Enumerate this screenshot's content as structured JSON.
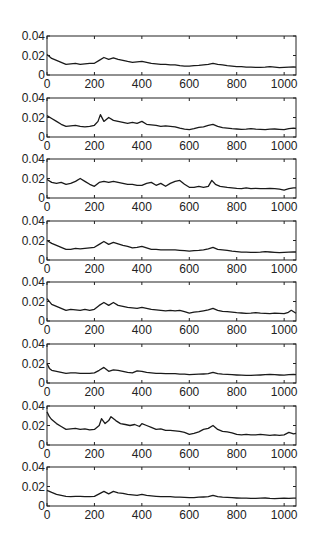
{
  "figure": {
    "background": "#ffffff",
    "line_color": "#1a1a1a",
    "axis_color": "#222222"
  },
  "layout": {
    "plot_left": 47,
    "plot_right": 296,
    "first_top": 36,
    "pitch": 61.6,
    "plot_height": 39
  },
  "chart_data": [
    {
      "type": "line",
      "title": "",
      "xlabel": "",
      "ylabel": "",
      "xlim": [
        0,
        1050
      ],
      "ylim": [
        0,
        0.04
      ],
      "xticks": [
        0,
        200,
        400,
        600,
        800,
        1000
      ],
      "xtick_labels": [
        "0",
        "200",
        "400",
        "600",
        "800",
        "1000"
      ],
      "yticks": [
        0,
        0.02,
        0.04
      ],
      "ytick_labels": [
        "0",
        "0.02",
        "0.04"
      ],
      "grid": false,
      "legend": null,
      "x": [
        0,
        20,
        40,
        60,
        80,
        100,
        120,
        140,
        160,
        180,
        200,
        220,
        240,
        260,
        280,
        300,
        320,
        340,
        360,
        380,
        400,
        420,
        440,
        460,
        480,
        500,
        520,
        540,
        560,
        580,
        600,
        620,
        640,
        660,
        680,
        700,
        720,
        740,
        760,
        780,
        800,
        820,
        840,
        860,
        880,
        900,
        920,
        940,
        960,
        980,
        1000,
        1020,
        1040,
        1050
      ],
      "values": [
        0.021,
        0.017,
        0.015,
        0.013,
        0.011,
        0.0115,
        0.012,
        0.011,
        0.0115,
        0.012,
        0.012,
        0.015,
        0.018,
        0.016,
        0.0175,
        0.016,
        0.015,
        0.014,
        0.013,
        0.0135,
        0.014,
        0.013,
        0.012,
        0.0115,
        0.011,
        0.011,
        0.0105,
        0.0105,
        0.0095,
        0.009,
        0.009,
        0.0095,
        0.01,
        0.0105,
        0.011,
        0.012,
        0.011,
        0.0105,
        0.0095,
        0.009,
        0.0085,
        0.0085,
        0.008,
        0.008,
        0.0078,
        0.0078,
        0.008,
        0.0085,
        0.008,
        0.0075,
        0.0078,
        0.008,
        0.0082,
        0.008
      ]
    },
    {
      "type": "line",
      "title": "",
      "xlabel": "",
      "ylabel": "",
      "xlim": [
        0,
        1050
      ],
      "ylim": [
        0,
        0.04
      ],
      "xticks": [
        0,
        200,
        400,
        600,
        800,
        1000
      ],
      "xtick_labels": [
        "0",
        "200",
        "400",
        "600",
        "800",
        "1000"
      ],
      "yticks": [
        0,
        0.02,
        0.04
      ],
      "ytick_labels": [
        "0",
        "0.02",
        "0.04"
      ],
      "grid": false,
      "legend": null,
      "x": [
        0,
        20,
        40,
        60,
        80,
        100,
        120,
        140,
        160,
        180,
        200,
        215,
        225,
        240,
        260,
        280,
        300,
        320,
        340,
        360,
        380,
        400,
        420,
        440,
        460,
        480,
        500,
        520,
        540,
        560,
        580,
        600,
        620,
        640,
        660,
        680,
        700,
        720,
        740,
        760,
        780,
        800,
        820,
        840,
        860,
        880,
        900,
        920,
        940,
        960,
        980,
        1000,
        1020,
        1040,
        1050
      ],
      "values": [
        0.022,
        0.019,
        0.016,
        0.013,
        0.011,
        0.0115,
        0.012,
        0.011,
        0.0105,
        0.011,
        0.012,
        0.016,
        0.023,
        0.016,
        0.02,
        0.017,
        0.016,
        0.015,
        0.014,
        0.015,
        0.014,
        0.016,
        0.013,
        0.0125,
        0.012,
        0.011,
        0.0115,
        0.011,
        0.0105,
        0.009,
        0.008,
        0.0075,
        0.0085,
        0.01,
        0.0105,
        0.012,
        0.013,
        0.011,
        0.0095,
        0.009,
        0.0085,
        0.0082,
        0.0078,
        0.008,
        0.0085,
        0.008,
        0.0078,
        0.0075,
        0.008,
        0.0082,
        0.0078,
        0.0075,
        0.0085,
        0.009,
        0.0088
      ]
    },
    {
      "type": "line",
      "title": "",
      "xlabel": "",
      "ylabel": "",
      "xlim": [
        0,
        1050
      ],
      "ylim": [
        0,
        0.04
      ],
      "xticks": [
        0,
        200,
        400,
        600,
        800,
        1000
      ],
      "xtick_labels": [
        "0",
        "200",
        "400",
        "600",
        "800",
        "1000"
      ],
      "yticks": [
        0,
        0.02,
        0.04
      ],
      "ytick_labels": [
        "0",
        "0.02",
        "0.04"
      ],
      "grid": false,
      "legend": null,
      "x": [
        0,
        20,
        40,
        60,
        80,
        100,
        120,
        140,
        160,
        180,
        200,
        220,
        240,
        260,
        280,
        300,
        320,
        340,
        360,
        380,
        400,
        420,
        440,
        460,
        480,
        500,
        520,
        540,
        560,
        580,
        600,
        620,
        640,
        660,
        680,
        695,
        710,
        730,
        760,
        780,
        800,
        820,
        840,
        860,
        880,
        900,
        920,
        940,
        960,
        980,
        1000,
        1020,
        1040,
        1050
      ],
      "values": [
        0.019,
        0.016,
        0.015,
        0.016,
        0.014,
        0.015,
        0.017,
        0.02,
        0.017,
        0.014,
        0.012,
        0.016,
        0.017,
        0.016,
        0.017,
        0.016,
        0.015,
        0.014,
        0.014,
        0.013,
        0.013,
        0.015,
        0.016,
        0.013,
        0.015,
        0.012,
        0.015,
        0.017,
        0.018,
        0.014,
        0.011,
        0.011,
        0.012,
        0.011,
        0.012,
        0.018,
        0.014,
        0.012,
        0.011,
        0.0105,
        0.01,
        0.0095,
        0.0105,
        0.0095,
        0.01,
        0.0095,
        0.0095,
        0.01,
        0.0095,
        0.009,
        0.008,
        0.0095,
        0.0105,
        0.0105
      ]
    },
    {
      "type": "line",
      "title": "",
      "xlabel": "",
      "ylabel": "",
      "xlim": [
        0,
        1050
      ],
      "ylim": [
        0,
        0.04
      ],
      "xticks": [
        0,
        200,
        400,
        600,
        800,
        1000
      ],
      "xtick_labels": [
        "0",
        "200",
        "400",
        "600",
        "800",
        "1000"
      ],
      "yticks": [
        0,
        0.02,
        0.04
      ],
      "ytick_labels": [
        "0",
        "0.02",
        "0.04"
      ],
      "grid": false,
      "legend": null,
      "x": [
        0,
        20,
        40,
        60,
        80,
        100,
        120,
        140,
        160,
        180,
        200,
        220,
        240,
        260,
        280,
        300,
        320,
        340,
        360,
        380,
        400,
        420,
        440,
        460,
        480,
        500,
        520,
        540,
        560,
        580,
        600,
        620,
        640,
        660,
        680,
        700,
        720,
        740,
        760,
        780,
        800,
        820,
        840,
        860,
        880,
        900,
        920,
        940,
        960,
        980,
        1000,
        1020,
        1040,
        1050
      ],
      "values": [
        0.02,
        0.017,
        0.015,
        0.013,
        0.011,
        0.011,
        0.012,
        0.0115,
        0.012,
        0.0125,
        0.013,
        0.016,
        0.019,
        0.016,
        0.018,
        0.0165,
        0.015,
        0.014,
        0.0125,
        0.013,
        0.014,
        0.0125,
        0.011,
        0.011,
        0.0105,
        0.0105,
        0.0105,
        0.0105,
        0.01,
        0.0095,
        0.009,
        0.0095,
        0.01,
        0.0105,
        0.0115,
        0.013,
        0.011,
        0.0105,
        0.01,
        0.009,
        0.0085,
        0.008,
        0.008,
        0.0078,
        0.0078,
        0.008,
        0.0085,
        0.0082,
        0.0078,
        0.0075,
        0.0078,
        0.008,
        0.0082,
        0.0082
      ]
    },
    {
      "type": "line",
      "title": "",
      "xlabel": "",
      "ylabel": "",
      "xlim": [
        0,
        1050
      ],
      "ylim": [
        0,
        0.04
      ],
      "xticks": [
        0,
        200,
        400,
        600,
        800,
        1000
      ],
      "xtick_labels": [
        "0",
        "200",
        "400",
        "600",
        "800",
        "1000"
      ],
      "yticks": [
        0,
        0.02,
        0.04
      ],
      "ytick_labels": [
        "0",
        "0.02",
        "0.04"
      ],
      "grid": false,
      "legend": null,
      "x": [
        0,
        20,
        40,
        60,
        80,
        100,
        120,
        140,
        160,
        180,
        200,
        220,
        240,
        260,
        280,
        300,
        320,
        340,
        360,
        380,
        400,
        420,
        440,
        460,
        480,
        500,
        520,
        540,
        560,
        580,
        600,
        620,
        640,
        660,
        680,
        700,
        720,
        740,
        760,
        780,
        800,
        820,
        840,
        860,
        880,
        900,
        920,
        940,
        960,
        980,
        1000,
        1015,
        1030,
        1050
      ],
      "values": [
        0.023,
        0.017,
        0.015,
        0.013,
        0.011,
        0.012,
        0.0115,
        0.011,
        0.012,
        0.011,
        0.012,
        0.016,
        0.019,
        0.016,
        0.019,
        0.016,
        0.015,
        0.014,
        0.0135,
        0.013,
        0.014,
        0.013,
        0.012,
        0.0115,
        0.011,
        0.0105,
        0.011,
        0.0105,
        0.011,
        0.0095,
        0.008,
        0.009,
        0.0095,
        0.0105,
        0.0115,
        0.013,
        0.011,
        0.01,
        0.0095,
        0.009,
        0.0085,
        0.0082,
        0.0078,
        0.008,
        0.0085,
        0.008,
        0.0078,
        0.0075,
        0.008,
        0.0078,
        0.0075,
        0.0085,
        0.011,
        0.008
      ]
    },
    {
      "type": "line",
      "title": "",
      "xlabel": "",
      "ylabel": "",
      "xlim": [
        0,
        1050
      ],
      "ylim": [
        0,
        0.04
      ],
      "xticks": [
        0,
        200,
        400,
        600,
        800,
        1000
      ],
      "xtick_labels": [
        "0",
        "200",
        "400",
        "600",
        "800",
        "1000"
      ],
      "yticks": [
        0,
        0.02,
        0.04
      ],
      "ytick_labels": [
        "0",
        "0.02",
        "0.04"
      ],
      "grid": false,
      "legend": null,
      "x": [
        0,
        10,
        20,
        40,
        60,
        80,
        100,
        120,
        140,
        160,
        180,
        200,
        220,
        240,
        260,
        280,
        300,
        320,
        340,
        360,
        380,
        400,
        420,
        440,
        460,
        480,
        500,
        520,
        540,
        560,
        580,
        600,
        620,
        640,
        660,
        680,
        700,
        720,
        740,
        760,
        780,
        800,
        820,
        840,
        860,
        880,
        900,
        920,
        940,
        960,
        980,
        1000,
        1020,
        1040,
        1050
      ],
      "values": [
        0.02,
        0.015,
        0.013,
        0.012,
        0.011,
        0.01,
        0.0105,
        0.0105,
        0.01,
        0.0098,
        0.01,
        0.0105,
        0.013,
        0.016,
        0.012,
        0.0135,
        0.013,
        0.012,
        0.011,
        0.0105,
        0.0125,
        0.012,
        0.011,
        0.0105,
        0.01,
        0.0098,
        0.0095,
        0.0095,
        0.0095,
        0.009,
        0.009,
        0.0085,
        0.0088,
        0.009,
        0.0092,
        0.0095,
        0.011,
        0.0095,
        0.009,
        0.0088,
        0.0085,
        0.0082,
        0.008,
        0.0078,
        0.0078,
        0.008,
        0.0082,
        0.0085,
        0.0088,
        0.0085,
        0.0082,
        0.008,
        0.0085,
        0.0088,
        0.0085
      ]
    },
    {
      "type": "line",
      "title": "",
      "xlabel": "",
      "ylabel": "",
      "xlim": [
        0,
        1050
      ],
      "ylim": [
        0,
        0.04
      ],
      "xticks": [
        0,
        200,
        400,
        600,
        800,
        1000
      ],
      "xtick_labels": [
        "0",
        "200",
        "400",
        "600",
        "800",
        "1000"
      ],
      "yticks": [
        0,
        0.02,
        0.04
      ],
      "ytick_labels": [
        "0",
        "0.02",
        "0.04"
      ],
      "grid": false,
      "legend": null,
      "x": [
        0,
        10,
        20,
        40,
        60,
        80,
        100,
        120,
        140,
        160,
        180,
        200,
        220,
        230,
        245,
        260,
        270,
        290,
        310,
        330,
        350,
        370,
        390,
        400,
        420,
        440,
        460,
        480,
        500,
        520,
        540,
        560,
        580,
        600,
        620,
        640,
        660,
        680,
        700,
        720,
        740,
        760,
        780,
        800,
        820,
        840,
        860,
        880,
        900,
        920,
        940,
        960,
        980,
        1000,
        1020,
        1040,
        1050
      ],
      "values": [
        0.034,
        0.029,
        0.026,
        0.022,
        0.019,
        0.016,
        0.0165,
        0.017,
        0.016,
        0.0165,
        0.0155,
        0.016,
        0.02,
        0.027,
        0.022,
        0.025,
        0.029,
        0.025,
        0.022,
        0.021,
        0.02,
        0.021,
        0.019,
        0.022,
        0.02,
        0.018,
        0.016,
        0.0165,
        0.015,
        0.015,
        0.0145,
        0.014,
        0.013,
        0.011,
        0.012,
        0.0135,
        0.016,
        0.017,
        0.02,
        0.016,
        0.014,
        0.0135,
        0.0125,
        0.011,
        0.0105,
        0.011,
        0.0105,
        0.0105,
        0.011,
        0.0105,
        0.01,
        0.0105,
        0.01,
        0.0105,
        0.013,
        0.0115,
        0.012
      ]
    },
    {
      "type": "line",
      "title": "",
      "xlabel": "",
      "ylabel": "",
      "xlim": [
        0,
        1050
      ],
      "ylim": [
        0,
        0.04
      ],
      "xticks": [
        0,
        200,
        400,
        600,
        800,
        1000
      ],
      "xtick_labels": [
        "0",
        "200",
        "400",
        "600",
        "800",
        "1000"
      ],
      "yticks": [
        0,
        0.02,
        0.04
      ],
      "ytick_labels": [
        "0",
        "0.02",
        "0.04"
      ],
      "grid": false,
      "legend": null,
      "x": [
        0,
        20,
        40,
        60,
        80,
        100,
        120,
        140,
        160,
        180,
        200,
        220,
        240,
        260,
        280,
        300,
        320,
        340,
        360,
        380,
        400,
        420,
        440,
        460,
        480,
        500,
        520,
        540,
        560,
        580,
        600,
        620,
        640,
        660,
        680,
        700,
        720,
        740,
        760,
        780,
        800,
        820,
        840,
        860,
        880,
        900,
        920,
        940,
        960,
        980,
        1000,
        1020,
        1040,
        1050
      ],
      "values": [
        0.016,
        0.014,
        0.012,
        0.011,
        0.01,
        0.0095,
        0.01,
        0.0098,
        0.0095,
        0.0095,
        0.01,
        0.0125,
        0.015,
        0.0125,
        0.015,
        0.0135,
        0.013,
        0.012,
        0.0115,
        0.011,
        0.012,
        0.011,
        0.0105,
        0.01,
        0.0095,
        0.0095,
        0.0095,
        0.009,
        0.009,
        0.0088,
        0.0085,
        0.0085,
        0.009,
        0.0092,
        0.0095,
        0.011,
        0.0095,
        0.009,
        0.0088,
        0.0085,
        0.0082,
        0.008,
        0.008,
        0.0078,
        0.0078,
        0.008,
        0.0082,
        0.0078,
        0.0075,
        0.0078,
        0.008,
        0.0078,
        0.008,
        0.008
      ]
    }
  ]
}
